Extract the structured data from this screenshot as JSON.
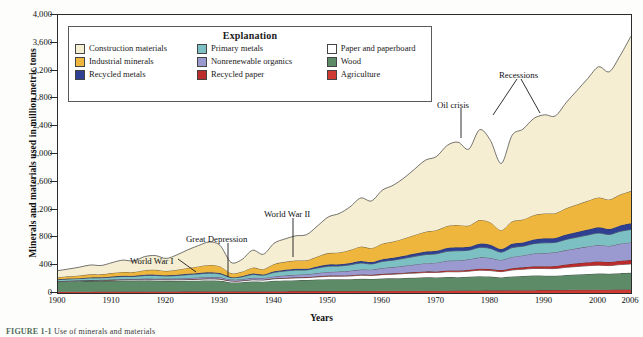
{
  "figure": {
    "caption_label": "FIGURE 1-1",
    "caption_text": "Use of minerals and materials"
  },
  "axes": {
    "ylabel": "Minerals and materials used in million metric tons",
    "xlabel": "Years",
    "yticks": [
      0,
      400,
      800,
      1200,
      1600,
      2000,
      2400,
      2800,
      3200,
      3600,
      4000
    ],
    "ytick_labels": [
      "0",
      "400",
      "800",
      "1,200",
      "1,600",
      "2,000",
      "2,400",
      "2,800",
      "3,200",
      "3,600",
      "4,000"
    ],
    "xticks": [
      1900,
      1910,
      1920,
      1930,
      1940,
      1950,
      1960,
      1970,
      1980,
      1990,
      2000,
      2006
    ],
    "xtick_labels": [
      "1900",
      "1910",
      "1920",
      "1930",
      "1940",
      "1950",
      "1960",
      "1970",
      "1980",
      "1990",
      "2000",
      "2006"
    ],
    "ylim": [
      0,
      4000
    ],
    "xlim": [
      1900,
      2006
    ]
  },
  "legend": {
    "title": "Explanation",
    "columns": [
      [
        {
          "label": "Construction materials",
          "color": "#f5eed2"
        },
        {
          "label": "Industrial minerals",
          "color": "#eeb63c"
        },
        {
          "label": "Recycled metals",
          "color": "#2f3f91"
        }
      ],
      [
        {
          "label": "Primary metals",
          "color": "#7dc0c4"
        },
        {
          "label": "Nonrenewable organics",
          "color": "#9a9ad0"
        },
        {
          "label": "Recycled paper",
          "color": "#bb2b2b"
        }
      ],
      [
        {
          "label": "Paper and paperboard",
          "color": "#ffffff"
        },
        {
          "label": "Wood",
          "color": "#5d8a67"
        },
        {
          "label": "Agriculture",
          "color": "#cf3b32"
        }
      ]
    ]
  },
  "annotations": [
    {
      "text": "World War I",
      "x": 130,
      "y": 256
    },
    {
      "text": "Great Depression",
      "x": 186,
      "y": 234
    },
    {
      "text": "World War II",
      "x": 264,
      "y": 209
    },
    {
      "text": "Oil crisis",
      "x": 437,
      "y": 100
    },
    {
      "text": "Recessions",
      "x": 499,
      "y": 70
    }
  ],
  "chart_data": {
    "type": "area",
    "title": "Use of minerals and materials",
    "xlabel": "Years",
    "ylabel": "Minerals and materials used in million metric tons",
    "xlim": [
      1900,
      2006
    ],
    "ylim": [
      0,
      4000
    ],
    "grid": false,
    "legend_position": "inside-top-left",
    "stack_order_bottom_to_top": [
      "Agriculture",
      "Wood",
      "Paper and paperboard",
      "Recycled paper",
      "Nonrenewable organics",
      "Primary metals",
      "Recycled metals",
      "Industrial minerals",
      "Construction materials"
    ],
    "x": [
      1900,
      1902,
      1904,
      1906,
      1908,
      1910,
      1912,
      1914,
      1916,
      1918,
      1920,
      1922,
      1924,
      1926,
      1928,
      1930,
      1932,
      1934,
      1936,
      1938,
      1940,
      1942,
      1944,
      1946,
      1948,
      1950,
      1952,
      1954,
      1956,
      1958,
      1960,
      1962,
      1964,
      1966,
      1968,
      1970,
      1972,
      1974,
      1976,
      1978,
      1980,
      1982,
      1984,
      1986,
      1988,
      1990,
      1992,
      1994,
      1996,
      1998,
      2000,
      2002,
      2004,
      2006
    ],
    "series": [
      {
        "name": "Agriculture",
        "color": "#cf3b32",
        "values": [
          18,
          18,
          19,
          19,
          20,
          20,
          21,
          21,
          22,
          22,
          23,
          23,
          24,
          24,
          25,
          25,
          24,
          24,
          25,
          25,
          26,
          26,
          27,
          27,
          28,
          28,
          29,
          29,
          30,
          30,
          31,
          31,
          32,
          32,
          33,
          33,
          34,
          35,
          36,
          37,
          38,
          38,
          39,
          40,
          41,
          42,
          43,
          44,
          45,
          46,
          47,
          48,
          49,
          50
        ]
      },
      {
        "name": "Wood",
        "color": "#5d8a67",
        "values": [
          145,
          148,
          150,
          152,
          153,
          155,
          156,
          156,
          157,
          155,
          150,
          150,
          152,
          154,
          155,
          150,
          128,
          130,
          140,
          138,
          150,
          155,
          158,
          160,
          165,
          170,
          168,
          170,
          175,
          172,
          178,
          180,
          185,
          188,
          192,
          190,
          196,
          192,
          198,
          205,
          198,
          185,
          200,
          205,
          212,
          208,
          205,
          215,
          222,
          228,
          232,
          228,
          236,
          240
        ]
      },
      {
        "name": "Paper and paperboard",
        "color": "#ffffff",
        "values": [
          5,
          6,
          7,
          8,
          9,
          10,
          11,
          12,
          13,
          13,
          15,
          16,
          18,
          20,
          22,
          23,
          19,
          20,
          24,
          23,
          28,
          30,
          32,
          34,
          38,
          42,
          44,
          46,
          50,
          50,
          55,
          58,
          62,
          66,
          70,
          72,
          76,
          78,
          80,
          86,
          86,
          84,
          92,
          96,
          100,
          102,
          104,
          110,
          114,
          118,
          122,
          118,
          124,
          128
        ]
      },
      {
        "name": "Recycled paper",
        "color": "#bb2b2b",
        "values": [
          2,
          2,
          2,
          3,
          3,
          3,
          4,
          4,
          4,
          4,
          5,
          5,
          5,
          6,
          6,
          6,
          5,
          5,
          6,
          6,
          7,
          8,
          9,
          9,
          10,
          11,
          11,
          12,
          12,
          12,
          13,
          14,
          14,
          15,
          16,
          16,
          18,
          19,
          20,
          22,
          23,
          23,
          26,
          28,
          31,
          34,
          38,
          42,
          46,
          50,
          54,
          52,
          56,
          58
        ]
      },
      {
        "name": "Nonrenewable organics",
        "color": "#9a9ad0",
        "values": [
          3,
          4,
          4,
          5,
          6,
          7,
          8,
          9,
          11,
          12,
          14,
          15,
          17,
          19,
          21,
          22,
          18,
          19,
          23,
          24,
          28,
          32,
          36,
          40,
          46,
          52,
          56,
          62,
          70,
          72,
          82,
          90,
          98,
          108,
          118,
          126,
          140,
          144,
          150,
          162,
          158,
          146,
          162,
          172,
          184,
          190,
          196,
          206,
          216,
          226,
          236,
          232,
          244,
          252
        ]
      },
      {
        "name": "Primary metals",
        "color": "#7dc0c4",
        "values": [
          20,
          24,
          26,
          30,
          28,
          34,
          38,
          36,
          44,
          46,
          38,
          42,
          48,
          52,
          56,
          48,
          28,
          34,
          48,
          40,
          58,
          66,
          68,
          62,
          74,
          82,
          80,
          86,
          94,
          82,
          96,
          100,
          108,
          118,
          124,
          126,
          136,
          140,
          132,
          144,
          138,
          112,
          134,
          132,
          142,
          146,
          142,
          154,
          160,
          166,
          172,
          164,
          178,
          186
        ]
      },
      {
        "name": "Recycled metals",
        "color": "#2f3f91",
        "values": [
          4,
          5,
          6,
          7,
          7,
          8,
          9,
          9,
          11,
          12,
          10,
          11,
          13,
          14,
          15,
          13,
          8,
          10,
          13,
          11,
          16,
          19,
          20,
          18,
          22,
          25,
          25,
          27,
          30,
          27,
          31,
          33,
          36,
          40,
          43,
          44,
          48,
          50,
          48,
          54,
          52,
          44,
          54,
          54,
          60,
          64,
          64,
          70,
          74,
          78,
          82,
          80,
          86,
          90
        ]
      },
      {
        "name": "Industrial minerals",
        "color": "#eeb63c",
        "values": [
          30,
          34,
          38,
          44,
          42,
          50,
          56,
          54,
          66,
          70,
          62,
          72,
          84,
          94,
          104,
          96,
          56,
          64,
          86,
          76,
          104,
          112,
          118,
          120,
          142,
          164,
          170,
          186,
          206,
          200,
          224,
          234,
          250,
          268,
          286,
          296,
          316,
          322,
          306,
          340,
          322,
          272,
          322,
          330,
          350,
          358,
          356,
          378,
          396,
          414,
          430,
          422,
          444,
          462
        ]
      },
      {
        "name": "Construction materials",
        "color": "#f5eed2",
        "values": [
          95,
          105,
          120,
          135,
          128,
          150,
          170,
          160,
          195,
          205,
          180,
          215,
          260,
          300,
          330,
          300,
          155,
          175,
          250,
          215,
          300,
          330,
          355,
          370,
          440,
          520,
          560,
          620,
          700,
          680,
          770,
          810,
          870,
          950,
          1030,
          1060,
          1160,
          1190,
          1100,
          1300,
          1180,
          960,
          1240,
          1300,
          1390,
          1420,
          1400,
          1520,
          1640,
          1760,
          1880,
          1840,
          2000,
          2230
        ]
      }
    ],
    "total_2006": 3696,
    "total_1900": 322,
    "notes": [
      "Peak at 2006 reaches approximately 3,700 million metric tons",
      "Great Depression trough near 1932 at about 450 million metric tons",
      "Oil crisis dip around 1975 and 1982 recession dip visible in top layer"
    ]
  }
}
